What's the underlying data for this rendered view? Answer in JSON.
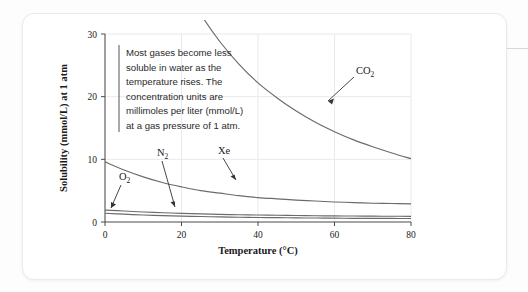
{
  "figure": {
    "callout": {
      "lines": [
        "Most gases become less",
        "soluble in water as the",
        "temperature rises. The",
        "concentration units are",
        "millimoles per liter (mmol/L)",
        "at a gas pressure of 1 atm."
      ]
    }
  },
  "chart_data": {
    "type": "line",
    "title": "",
    "xlabel": "Temperature (°C)",
    "ylabel": "Solubility (mmol/L) at 1 atm",
    "xlim": [
      0,
      80
    ],
    "ylim": [
      0,
      30
    ],
    "xticks": [
      0,
      20,
      40,
      60,
      80
    ],
    "yticks": [
      0,
      10,
      20,
      30
    ],
    "xtick_labels": [
      "0",
      "20",
      "40",
      "60",
      "80"
    ],
    "ytick_labels": [
      "0",
      "10",
      "20",
      "30"
    ],
    "grid": true,
    "grid_color": "#e9e9ef",
    "legend": "inline-labels",
    "line_color": "#6b6b6b",
    "x": [
      0,
      5,
      10,
      15,
      20,
      25,
      30,
      35,
      40,
      45,
      50,
      55,
      60,
      65,
      70,
      75,
      80
    ],
    "series": [
      {
        "name": "CO2",
        "label": "CO",
        "sub": "2",
        "values": [
          76.0,
          63.0,
          53.0,
          45.0,
          38.5,
          33.2,
          28.8,
          25.2,
          22.2,
          19.8,
          17.7,
          15.9,
          14.4,
          13.1,
          12.0,
          11.0,
          10.1
        ]
      },
      {
        "name": "Xe",
        "label": "Xe",
        "sub": "",
        "values": [
          9.6,
          8.3,
          7.2,
          6.3,
          5.6,
          5.0,
          4.6,
          4.2,
          3.9,
          3.7,
          3.5,
          3.35,
          3.2,
          3.1,
          3.0,
          2.95,
          2.9
        ]
      },
      {
        "name": "N2",
        "label": "N",
        "sub": "2",
        "values": [
          1.9,
          1.75,
          1.6,
          1.48,
          1.38,
          1.3,
          1.22,
          1.16,
          1.11,
          1.07,
          1.03,
          1.0,
          0.97,
          0.95,
          0.93,
          0.92,
          0.9
        ]
      },
      {
        "name": "O2",
        "label": "O",
        "sub": "2",
        "values": [
          1.4,
          1.25,
          1.12,
          1.02,
          0.94,
          0.87,
          0.81,
          0.76,
          0.72,
          0.69,
          0.66,
          0.63,
          0.61,
          0.59,
          0.58,
          0.57,
          0.56
        ]
      }
    ],
    "annotations": [
      {
        "name": "CO2",
        "label_x": 355,
        "label_y": 85
      },
      {
        "name": "Xe",
        "label_x": 190,
        "label_y": 160
      },
      {
        "name": "N2",
        "label_x": 160,
        "label_y": 170
      },
      {
        "name": "O2",
        "label_x": 122,
        "label_y": 190
      }
    ]
  }
}
